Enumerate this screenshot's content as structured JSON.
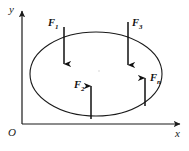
{
  "figure": {
    "type": "force-diagram",
    "background_color": "#ffffff",
    "line_color": "#1a1a1a",
    "caption": ""
  },
  "axes": {
    "origin_label": "O",
    "x_label": "x",
    "y_label": "y",
    "x_axis": {
      "x1": 22,
      "y1": 124,
      "x2": 183,
      "y2": 124
    },
    "y_axis": {
      "x1": 22,
      "y1": 124,
      "x2": 22,
      "y2": 8
    },
    "origin_label_pos": {
      "x": 11,
      "y": 133
    },
    "x_label_pos": {
      "x": 178,
      "y": 135
    },
    "y_label_pos": {
      "x": 9,
      "y": 12
    }
  },
  "region": {
    "name": "closed-region-ellipse",
    "cx": 96,
    "cy": 74,
    "rx": 66,
    "ry": 42,
    "stroke": "#1a1a1a",
    "stroke_width": 1.1,
    "fill": "none"
  },
  "forces": [
    {
      "id": "F1",
      "label_base": "F",
      "label_sub": "1",
      "direction": "down",
      "x": 64,
      "y_start": 27,
      "y_end": 71,
      "label_x": 50,
      "label_y": 25
    },
    {
      "id": "F3",
      "label_base": "F",
      "label_sub": "3",
      "direction": "down",
      "x": 128,
      "y_start": 22,
      "y_end": 72,
      "label_x": 132,
      "label_y": 24
    },
    {
      "id": "F2",
      "label_base": "F",
      "label_sub": "2",
      "direction": "up",
      "x": 91,
      "y_start": 119,
      "y_end": 79,
      "label_x": 76,
      "label_y": 87
    },
    {
      "id": "Fn",
      "label_base": "F",
      "label_sub": "n",
      "direction": "up",
      "x": 145,
      "y_start": 106,
      "y_end": 71,
      "label_x": 150,
      "label_y": 79
    }
  ]
}
